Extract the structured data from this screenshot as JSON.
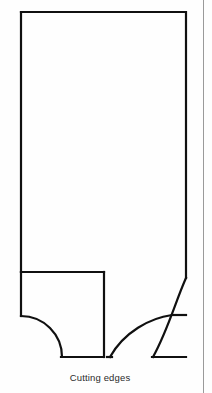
{
  "figure": {
    "caption": "Cutting edges",
    "stroke_color": "#101010",
    "fill_color": "#ffffff",
    "background_color": "#fefefe",
    "rule_color": "#9a9a9a",
    "geometry": {
      "type": "technical-line-drawing",
      "description": "Elevation outline of a tool blank showing two cutting edges formed by concave fillet arcs at the bottom",
      "body_left_x": 21,
      "body_right_x": 186,
      "body_top_y": 12,
      "shoulder_y": 272,
      "right_shoulder_y": 278,
      "notch_left_bottom_y": 316,
      "inner_arc_corner_y": 315,
      "baseline_y": 357,
      "divider_x": 104,
      "left_arc_end_x": 62,
      "inner_arc_end_x": 110,
      "outer_arc_end_x": 153,
      "paths": {
        "outline": "M 21 12 L 186 12 L 186 278",
        "left_shoulder": "M 21 272 L 104 272",
        "left_edge_lower": "M 21 272 L 21 316",
        "left_fillet_arc": "M 21 316 A 41 41 0 0 1 62 357",
        "left_baseline": "M 62 357 L 101 357",
        "divider": "M 104 272 L 104 357",
        "outer_fillet_arc": "M 186 278 A 79 79 0 0 0 153 357",
        "outer_baseline": "M 153 357 L 186 357",
        "inner_corner": "M 186 315 L 173 315",
        "inner_fillet_arc": "M 173 315 A 63 63 0 0 0 110 357",
        "inner_baseline": "M 110 357 L 107 357"
      }
    }
  }
}
